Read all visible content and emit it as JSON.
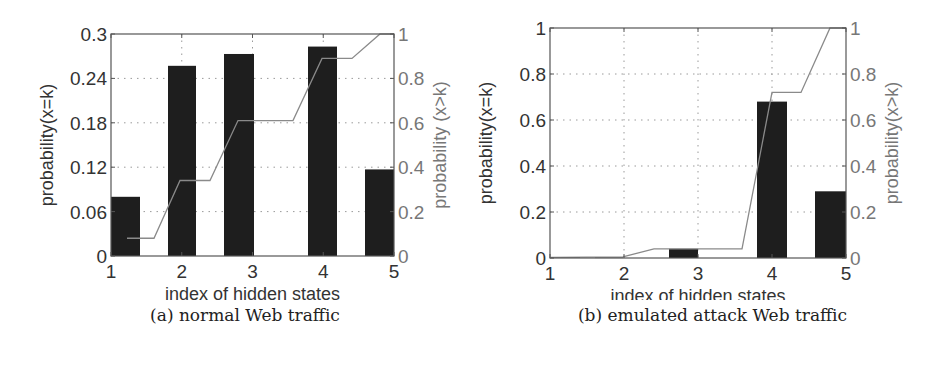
{
  "chart_data": [
    {
      "id": "a",
      "type": "bar",
      "caption": "(a) normal Web traffic",
      "xlabel": "index of hidden states",
      "ylabel": "probability(x=k)",
      "ylabel_right": "probability (x>k)",
      "categories": [
        "1",
        "2",
        "3",
        "4",
        "5"
      ],
      "x_ticks": [
        1,
        2,
        3,
        4,
        5
      ],
      "xlim": [
        1,
        5
      ],
      "ylim": [
        0,
        0.3
      ],
      "y_ticks": [
        0,
        0.06,
        0.12,
        0.18,
        0.24,
        0.3
      ],
      "y_tick_labels": [
        "0",
        "0.06",
        "0.12",
        "0.18",
        "0.24",
        "0.3"
      ],
      "ylim_right": [
        0,
        1
      ],
      "y_ticks_right": [
        0,
        0.2,
        0.4,
        0.6,
        0.8,
        1
      ],
      "y_tick_labels_right": [
        "0",
        "0.2",
        "0.4",
        "0.6",
        "0.8",
        "1"
      ],
      "grid": true,
      "series": [
        {
          "name": "probability(x=k)",
          "type": "bar",
          "axis": "left",
          "color": "#1e1e1e",
          "values": [
            0.08,
            0.257,
            0.273,
            0.283,
            0.117
          ]
        },
        {
          "name": "cumulative probability",
          "type": "line",
          "axis": "right",
          "color": "#8a8a8a",
          "values": [
            0.08,
            0.34,
            0.61,
            0.89,
            1.0
          ]
        }
      ],
      "render": {
        "axes_box": {
          "left": 111,
          "top": 34,
          "right": 394,
          "bottom": 256
        },
        "bars_px": [
          [
            111,
            140
          ],
          [
            168,
            196
          ],
          [
            224,
            254
          ],
          [
            308,
            337
          ],
          [
            365,
            394
          ]
        ],
        "line_px": [
          [
            127,
            0.08
          ],
          [
            154,
            0.08
          ],
          [
            180,
            0.34
          ],
          [
            210,
            0.34
          ],
          [
            238,
            0.61
          ],
          [
            293,
            0.61
          ],
          [
            322,
            0.89
          ],
          [
            352,
            0.89
          ],
          [
            380,
            1.0
          ],
          [
            394,
            1.0
          ]
        ]
      }
    },
    {
      "id": "b",
      "type": "bar",
      "caption": "(b) emulated attack Web traffic",
      "xlabel": "index of hidden states",
      "ylabel": "probability(x=k)",
      "ylabel_right": "probability(x>k)",
      "categories": [
        "1",
        "2",
        "3",
        "4",
        "5"
      ],
      "x_ticks": [
        1,
        2,
        3,
        4,
        5
      ],
      "xlim": [
        1,
        5
      ],
      "ylim": [
        0,
        1
      ],
      "y_ticks": [
        0,
        0.2,
        0.4,
        0.6,
        0.8,
        1
      ],
      "y_tick_labels": [
        "0",
        "0.2",
        "0.4",
        "0.6",
        "0.8",
        "1"
      ],
      "ylim_right": [
        0,
        1
      ],
      "y_ticks_right": [
        0,
        0.2,
        0.4,
        0.6,
        0.8,
        1
      ],
      "y_tick_labels_right": [
        "0",
        "0.2",
        "0.4",
        "0.6",
        "0.8",
        "1"
      ],
      "grid": true,
      "series": [
        {
          "name": "probability(x=k)",
          "type": "bar",
          "axis": "left",
          "color": "#1e1e1e",
          "values": [
            0.003,
            0.002,
            0.04,
            0.68,
            0.29
          ]
        },
        {
          "name": "cumulative probability",
          "type": "line",
          "axis": "right",
          "color": "#8a8a8a",
          "values": [
            0.003,
            0.005,
            0.04,
            0.72,
            1.0
          ]
        }
      ],
      "render": {
        "axes_box": {
          "left": 550,
          "top": 28,
          "right": 846,
          "bottom": 258
        },
        "bars_px": [
          [
            551,
            580
          ],
          [
            595,
            623
          ],
          [
            669,
            698
          ],
          [
            757,
            787
          ],
          [
            815,
            846
          ]
        ],
        "line_px": [
          [
            551,
            0.003
          ],
          [
            623,
            0.005
          ],
          [
            654,
            0.04
          ],
          [
            742,
            0.04
          ],
          [
            772,
            0.72
          ],
          [
            801,
            0.72
          ],
          [
            830,
            1.0
          ],
          [
            846,
            1.0
          ]
        ]
      }
    }
  ]
}
